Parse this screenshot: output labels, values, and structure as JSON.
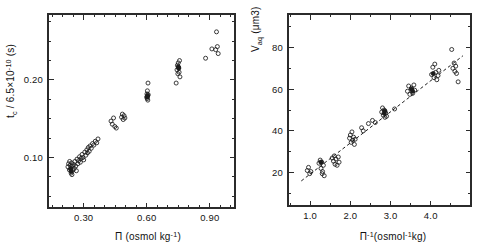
{
  "figure": {
    "background": "#ffffff",
    "ink": "#1b1b1b",
    "panel_count": 2
  },
  "chart_data": [
    {
      "type": "scatter",
      "panel": "left",
      "title": "",
      "xlabel": "Π (osmol kg⁻¹)",
      "xlabel_parts": {
        "symbol": "Π",
        "unit": "(osmol kg",
        "unit_sup": "-1",
        "unit_tail": ")"
      },
      "ylabel": "t_c / 6.5×10⁻¹⁰ (s)",
      "ylabel_parts": {
        "lead": "t",
        "lead_sub": "c",
        "mid": " / 6.5×10",
        "mid_sup": "-10",
        "tail": " (s)"
      },
      "xlim": [
        0.13,
        1.02
      ],
      "ylim": [
        0.035,
        0.285
      ],
      "xticks": [
        0.3,
        0.6,
        0.9
      ],
      "xticklabels": [
        "0.30",
        "0.60",
        "0.90"
      ],
      "xminorticks": [
        0.15,
        0.2,
        0.25,
        0.35,
        0.4,
        0.45,
        0.5,
        0.55,
        0.65,
        0.7,
        0.75,
        0.8,
        0.85,
        0.95,
        1.0
      ],
      "yticks": [
        0.1,
        0.2
      ],
      "yticklabels": [
        "0.10",
        "0.20"
      ],
      "yminorticks": [
        0.05,
        0.075,
        0.125,
        0.15,
        0.175,
        0.225,
        0.25,
        0.275
      ],
      "grid": false,
      "legend": false,
      "marker": "open-circle",
      "points": [
        [
          0.225,
          0.088
        ],
        [
          0.228,
          0.092
        ],
        [
          0.232,
          0.084
        ],
        [
          0.233,
          0.095
        ],
        [
          0.236,
          0.09
        ],
        [
          0.238,
          0.086
        ],
        [
          0.24,
          0.08
        ],
        [
          0.242,
          0.093
        ],
        [
          0.244,
          0.078
        ],
        [
          0.246,
          0.089
        ],
        [
          0.249,
          0.084
        ],
        [
          0.252,
          0.091
        ],
        [
          0.255,
          0.086
        ],
        [
          0.258,
          0.095
        ],
        [
          0.262,
          0.089
        ],
        [
          0.265,
          0.083
        ],
        [
          0.268,
          0.098
        ],
        [
          0.272,
          0.092
        ],
        [
          0.276,
          0.096
        ],
        [
          0.28,
          0.101
        ],
        [
          0.284,
          0.094
        ],
        [
          0.288,
          0.099
        ],
        [
          0.292,
          0.104
        ],
        [
          0.296,
          0.1
        ],
        [
          0.3,
          0.097
        ],
        [
          0.305,
          0.107
        ],
        [
          0.31,
          0.103
        ],
        [
          0.315,
          0.11
        ],
        [
          0.318,
          0.106
        ],
        [
          0.322,
          0.113
        ],
        [
          0.326,
          0.108
        ],
        [
          0.33,
          0.115
        ],
        [
          0.336,
          0.112
        ],
        [
          0.342,
          0.118
        ],
        [
          0.348,
          0.116
        ],
        [
          0.355,
          0.121
        ],
        [
          0.362,
          0.119
        ],
        [
          0.368,
          0.124
        ],
        [
          0.43,
          0.147
        ],
        [
          0.436,
          0.143
        ],
        [
          0.442,
          0.151
        ],
        [
          0.448,
          0.14
        ],
        [
          0.455,
          0.138
        ],
        [
          0.48,
          0.152
        ],
        [
          0.484,
          0.156
        ],
        [
          0.488,
          0.149
        ],
        [
          0.492,
          0.154
        ],
        [
          0.496,
          0.151
        ],
        [
          0.6,
          0.178
        ],
        [
          0.601,
          0.182
        ],
        [
          0.602,
          0.176
        ],
        [
          0.603,
          0.186
        ],
        [
          0.604,
          0.179
        ],
        [
          0.605,
          0.174
        ],
        [
          0.606,
          0.196
        ],
        [
          0.607,
          0.181
        ],
        [
          0.744,
          0.213
        ],
        [
          0.746,
          0.219
        ],
        [
          0.748,
          0.208
        ],
        [
          0.75,
          0.222
        ],
        [
          0.752,
          0.216
        ],
        [
          0.754,
          0.21
        ],
        [
          0.756,
          0.225
        ],
        [
          0.74,
          0.196
        ],
        [
          0.758,
          0.204
        ],
        [
          0.88,
          0.228
        ],
        [
          0.932,
          0.262
        ],
        [
          0.928,
          0.239
        ],
        [
          0.936,
          0.243
        ],
        [
          0.94,
          0.234
        ],
        [
          0.91,
          0.24
        ]
      ],
      "filled_points": [
        [
          0.238,
          0.085
        ],
        [
          0.241,
          0.082
        ],
        [
          0.602,
          0.178
        ],
        [
          0.604,
          0.18
        ],
        [
          0.75,
          0.217
        ],
        [
          0.752,
          0.215
        ]
      ]
    },
    {
      "type": "scatter",
      "panel": "right",
      "title": "",
      "xlabel": "Π⁻¹ (osmol⁻¹ kg)",
      "xlabel_parts": {
        "symbol": "Π",
        "symbol_sup": "-1",
        "unit": "(osmol",
        "unit_sup": "-1",
        "unit_tail": "kg)"
      },
      "ylabel": "V_aq (μm3)",
      "ylabel_parts": {
        "lead": "V",
        "lead_sub": "aq",
        "tail": " (μm3)"
      },
      "xlim": [
        0.45,
        5.0
      ],
      "ylim": [
        4,
        96
      ],
      "xticks": [
        1.0,
        2.0,
        3.0,
        4.0
      ],
      "xticklabels": [
        "1.0",
        "2.0",
        "3.0",
        "4.0"
      ],
      "xminorticks": [
        0.5,
        1.5,
        2.5,
        3.5,
        4.5
      ],
      "yticks": [
        20,
        40,
        60,
        80
      ],
      "yticklabels": [
        "20",
        "40",
        "60",
        "80"
      ],
      "yminorticks": [
        10,
        30,
        50,
        70,
        90
      ],
      "grid": false,
      "legend": false,
      "marker": "open-circle",
      "fit_line": {
        "x1": 0.78,
        "y1": 16.0,
        "x2": 4.8,
        "y2": 76.0,
        "style": "dashed"
      },
      "points": [
        [
          0.93,
          21.0
        ],
        [
          0.96,
          22.5
        ],
        [
          0.99,
          19.5
        ],
        [
          1.02,
          20.5
        ],
        [
          1.22,
          24.5
        ],
        [
          1.25,
          26.0
        ],
        [
          1.27,
          22.0
        ],
        [
          1.29,
          25.0
        ],
        [
          1.31,
          20.5
        ],
        [
          1.33,
          23.5
        ],
        [
          1.35,
          18.5
        ],
        [
          1.3,
          19.5
        ],
        [
          1.55,
          27.0
        ],
        [
          1.58,
          25.5
        ],
        [
          1.6,
          28.0
        ],
        [
          1.62,
          24.0
        ],
        [
          1.64,
          26.5
        ],
        [
          1.67,
          23.5
        ],
        [
          1.7,
          27.5
        ],
        [
          1.72,
          25.0
        ],
        [
          1.98,
          36.5
        ],
        [
          2.0,
          38.0
        ],
        [
          2.02,
          34.5
        ],
        [
          2.04,
          39.5
        ],
        [
          2.06,
          35.5
        ],
        [
          2.08,
          37.0
        ],
        [
          2.1,
          33.5
        ],
        [
          2.12,
          36.0
        ],
        [
          2.28,
          41.5
        ],
        [
          2.32,
          40.0
        ],
        [
          2.45,
          43.5
        ],
        [
          2.55,
          45.0
        ],
        [
          2.62,
          44.0
        ],
        [
          2.78,
          49.0
        ],
        [
          2.8,
          51.0
        ],
        [
          2.82,
          47.5
        ],
        [
          2.84,
          50.0
        ],
        [
          2.86,
          46.5
        ],
        [
          2.88,
          48.5
        ],
        [
          2.9,
          47.0
        ],
        [
          3.1,
          50.5
        ],
        [
          3.42,
          59.0
        ],
        [
          3.45,
          61.5
        ],
        [
          3.48,
          57.5
        ],
        [
          3.52,
          60.5
        ],
        [
          3.55,
          58.0
        ],
        [
          3.58,
          62.0
        ],
        [
          3.6,
          59.5
        ],
        [
          4.02,
          67.0
        ],
        [
          4.05,
          70.5
        ],
        [
          4.08,
          65.5
        ],
        [
          4.1,
          72.0
        ],
        [
          4.12,
          68.0
        ],
        [
          4.15,
          64.5
        ],
        [
          4.18,
          66.5
        ],
        [
          4.2,
          69.0
        ],
        [
          4.55,
          70.0
        ],
        [
          4.58,
          72.5
        ],
        [
          4.6,
          68.5
        ],
        [
          4.62,
          71.0
        ],
        [
          4.64,
          67.5
        ],
        [
          4.52,
          79.0
        ],
        [
          4.68,
          63.5
        ]
      ],
      "filled_points": [
        [
          2.84,
          48.5
        ],
        [
          2.86,
          49.5
        ],
        [
          3.52,
          60.0
        ],
        [
          3.55,
          59.0
        ],
        [
          4.06,
          67.5
        ],
        [
          1.27,
          25.0
        ]
      ]
    }
  ]
}
